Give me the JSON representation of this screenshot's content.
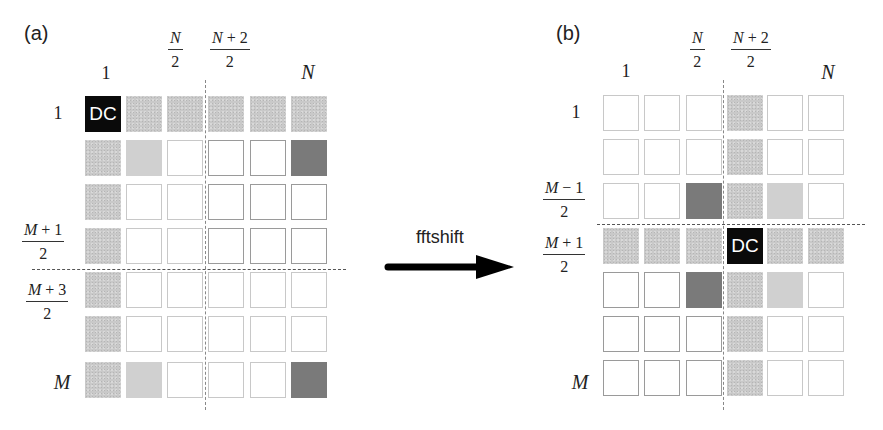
{
  "panel_a": {
    "label": "(a)",
    "col_labels": {
      "c1": "1",
      "cN2_num": "N",
      "cN2_den": "2",
      "cN22_num_var": "N",
      "cN22_num_rest": " + 2",
      "cN22_den": "2",
      "cN": "N"
    },
    "row_labels": {
      "r1": "1",
      "rM1_num_var": "M",
      "rM1_num_rest": " + 1",
      "rM1_den": "2",
      "rM3_num_var": "M",
      "rM3_num_rest": " + 3",
      "rM3_den": "2",
      "rM": "M"
    },
    "dc_label": "DC",
    "grid": [
      [
        "dc",
        "light",
        "light",
        "light",
        "light",
        "light"
      ],
      [
        "light",
        "lighter",
        "white",
        "white-strong",
        "white-strong",
        "dark"
      ],
      [
        "light",
        "white",
        "white",
        "white-strong",
        "white-strong",
        "white-strong"
      ],
      [
        "light",
        "white",
        "white",
        "white-strong",
        "white-strong",
        "white-strong"
      ],
      [
        "light",
        "white",
        "white",
        "white",
        "white",
        "white"
      ],
      [
        "light",
        "white",
        "white",
        "white",
        "white",
        "white"
      ],
      [
        "light",
        "lighter",
        "white",
        "white",
        "white",
        "dark"
      ]
    ]
  },
  "arrow": {
    "label": "fftshift"
  },
  "panel_b": {
    "label": "(b)",
    "col_labels": {
      "c1": "1",
      "cN2_num": "N",
      "cN2_den": "2",
      "cN22_num_var": "N",
      "cN22_num_rest": " + 2",
      "cN22_den": "2",
      "cN": "N"
    },
    "row_labels": {
      "r1": "1",
      "rMm1_num_var": "M",
      "rMm1_num_rest": " − 1",
      "rMm1_den": "2",
      "rM1_num_var": "M",
      "rM1_num_rest": " + 1",
      "rM1_den": "2",
      "rM": "M"
    },
    "dc_label": "DC",
    "grid": [
      [
        "white",
        "white",
        "white",
        "light",
        "white",
        "white"
      ],
      [
        "white",
        "white",
        "white",
        "light",
        "white",
        "white"
      ],
      [
        "white",
        "white",
        "dark",
        "light",
        "lighter",
        "white"
      ],
      [
        "light",
        "light",
        "light",
        "dc",
        "light",
        "light"
      ],
      [
        "white-strong",
        "white-strong",
        "dark",
        "light",
        "lighter",
        "white"
      ],
      [
        "white-strong",
        "white-strong",
        "white-strong",
        "light",
        "white",
        "white"
      ],
      [
        "white-strong",
        "white-strong",
        "white-strong",
        "light",
        "white",
        "white"
      ]
    ]
  },
  "colors": {
    "dc": "#0a0a0a",
    "light_gray": "#c9c9c9",
    "lighter_gray": "#d0d0d0",
    "dark_gray": "#7a7a7a",
    "dash": "#555555"
  }
}
